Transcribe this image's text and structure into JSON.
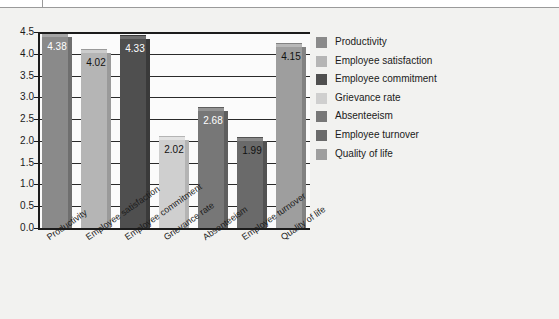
{
  "page": {
    "background_color": "#f2f2f0",
    "plot_background_color": "#fbfbfb",
    "axis_color": "#1c1c1c"
  },
  "chart_data": {
    "type": "bar",
    "title": "",
    "subtitle": "",
    "xlabel": "",
    "ylabel": "",
    "ylim": [
      0.0,
      4.5
    ],
    "ytick_step": 0.5,
    "grid": true,
    "grid_axis": "y",
    "legend_position": "right",
    "bar_style": "3d-column",
    "value_labels": true,
    "categories": [
      "Productivity",
      "Employee satisfaction",
      "Employee commitment",
      "Grievance rate",
      "Absenteeism",
      "Employee turnover",
      "Quality of life"
    ],
    "values": [
      4.38,
      4.02,
      4.33,
      2.02,
      2.68,
      1.99,
      4.15
    ],
    "value_labels_text": [
      "4.38",
      "4.02",
      "4.33",
      "2.02",
      "2.68",
      "1.99",
      "4.15"
    ],
    "value_label_colors": [
      "#ffffff",
      "#111111",
      "#ffffff",
      "#111111",
      "#ffffff",
      "#111111",
      "#111111"
    ],
    "ytick_labels": [
      "0.0",
      "0.5",
      "1.0",
      "1.5",
      "2.0",
      "2.5",
      "3.0",
      "3.5",
      "4.0",
      "4.5"
    ],
    "ytick_values": [
      0.0,
      0.5,
      1.0,
      1.5,
      2.0,
      2.5,
      3.0,
      3.5,
      4.0,
      4.5
    ],
    "colors": [
      "#8a8a8a",
      "#b5b5b5",
      "#4f4f4f",
      "#cfcfcf",
      "#777777",
      "#6a6a6a",
      "#9e9e9e"
    ],
    "colors_top": [
      "#a5a5a5",
      "#cccccc",
      "#6e6e6e",
      "#e2e2e2",
      "#949494",
      "#888888",
      "#b8b8b8"
    ],
    "colors_side": [
      "#6f6f6f",
      "#9a9a9a",
      "#3a3a3a",
      "#b4b4b4",
      "#5e5e5e",
      "#525252",
      "#828282"
    ],
    "series": [
      {
        "name": "values",
        "values": [
          4.38,
          4.02,
          4.33,
          2.02,
          2.68,
          1.99,
          4.15
        ]
      }
    ]
  },
  "legend": {
    "items": [
      {
        "label": "Productivity",
        "color": "#8a8a8a"
      },
      {
        "label": "Employee satisfaction",
        "color": "#b5b5b5"
      },
      {
        "label": "Employee commitment",
        "color": "#4f4f4f"
      },
      {
        "label": "Grievance rate",
        "color": "#cfcfcf"
      },
      {
        "label": "Absenteeism",
        "color": "#777777"
      },
      {
        "label": "Employee turnover",
        "color": "#6a6a6a"
      },
      {
        "label": "Quality of life",
        "color": "#9e9e9e"
      }
    ]
  }
}
